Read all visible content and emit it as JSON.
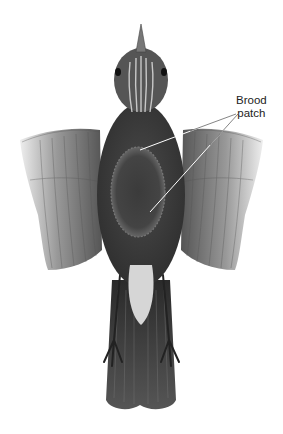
{
  "figure": {
    "colors": {
      "background": "#ffffff",
      "body_dark": "#3a3a3a",
      "body_mid": "#5a5a5a",
      "wing_light": "#bdbdbd",
      "wing_mid": "#8a8a8a",
      "undertail": "#d8d8d8",
      "leader_line": "#ffffff",
      "label_text": "#222222"
    }
  },
  "annotation": {
    "line1": "Brood",
    "line2": "patch",
    "target": "brood-patch"
  }
}
